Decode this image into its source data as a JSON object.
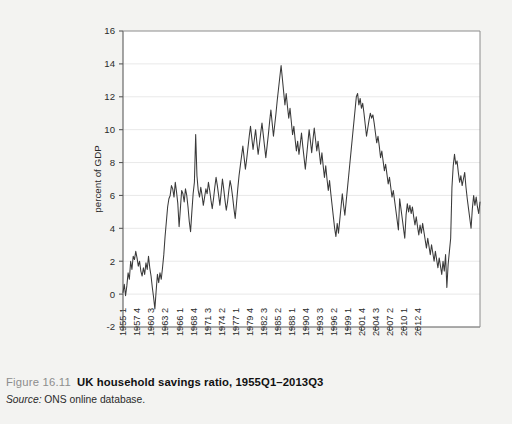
{
  "caption": {
    "figure_number": "Figure 16.11",
    "title": "UK household savings ratio, 1955Q1–2013Q3",
    "source_label": "Source:",
    "source_text": " ONS online database."
  },
  "chart_data": {
    "type": "line",
    "title": "",
    "xlabel": "",
    "ylabel": "percent of GDP",
    "ylim": [
      -2,
      16
    ],
    "ytick_values": [
      -2,
      0,
      2,
      4,
      6,
      8,
      10,
      12,
      14,
      16
    ],
    "ytick_labels": [
      "-2",
      "0",
      "2",
      "4",
      "6",
      "8",
      "10",
      "12",
      "14",
      "16"
    ],
    "grid": "horizontal",
    "legend": "none",
    "line_color": "#3a3a3a",
    "xtick_labels": [
      "1955 1",
      "1957 4",
      "1960 3",
      "1963 2",
      "1966 1",
      "1968 4",
      "1971 3",
      "1974 2",
      "1977 1",
      "1979 4",
      "1982 3",
      "1985 2",
      "1988 1",
      "1990 4",
      "1993 3",
      "1996 2",
      "1999 1",
      "2001 4",
      "2004 3",
      "2007 2",
      "2010 1",
      "2012 4"
    ],
    "xtick_indices": [
      0,
      11,
      22,
      33,
      44,
      55,
      66,
      77,
      88,
      99,
      110,
      121,
      132,
      143,
      154,
      165,
      176,
      187,
      198,
      209,
      220,
      231
    ],
    "x_start": "1955Q1",
    "x_end": "2013Q3",
    "n_points": 235,
    "values": [
      0.1,
      0.6,
      -0.1,
      0.5,
      1.3,
      0.9,
      2.0,
      1.5,
      2.3,
      2.1,
      2.6,
      2.2,
      1.7,
      2.0,
      1.4,
      1.1,
      1.6,
      1.2,
      1.9,
      1.5,
      2.3,
      1.6,
      1.1,
      0.4,
      -0.2,
      -0.9,
      0.2,
      1.2,
      0.7,
      1.3,
      0.9,
      1.6,
      2.4,
      3.5,
      4.4,
      5.3,
      5.8,
      6.0,
      6.6,
      6.4,
      5.9,
      6.8,
      6.2,
      5.5,
      4.1,
      5.2,
      6.3,
      6.1,
      5.6,
      6.4,
      6.0,
      5.3,
      4.4,
      3.8,
      5.0,
      6.1,
      6.8,
      9.7,
      7.2,
      6.3,
      5.9,
      6.5,
      6.0,
      5.4,
      5.9,
      6.4,
      6.1,
      6.8,
      6.3,
      5.7,
      5.2,
      5.8,
      6.5,
      7.1,
      6.6,
      6.0,
      5.4,
      6.2,
      7.0,
      6.4,
      5.7,
      5.1,
      5.6,
      6.3,
      6.9,
      6.5,
      5.9,
      5.2,
      4.6,
      5.5,
      6.4,
      7.2,
      7.8,
      8.4,
      9.0,
      8.3,
      7.6,
      8.2,
      8.9,
      9.6,
      10.2,
      9.5,
      8.8,
      9.4,
      10.0,
      9.2,
      8.5,
      9.1,
      9.8,
      10.4,
      9.7,
      9.0,
      8.3,
      9.0,
      9.7,
      10.5,
      11.2,
      10.4,
      9.6,
      10.3,
      11.0,
      11.8,
      12.5,
      13.2,
      13.9,
      13.1,
      12.3,
      11.5,
      12.2,
      11.4,
      10.7,
      11.3,
      10.5,
      9.7,
      10.2,
      9.4,
      8.7,
      9.3,
      8.5,
      9.1,
      9.8,
      9.0,
      8.3,
      7.6,
      8.4,
      9.2,
      10.0,
      9.3,
      8.6,
      9.4,
      10.1,
      9.4,
      8.7,
      9.3,
      8.6,
      7.9,
      8.6,
      7.8,
      7.1,
      7.8,
      7.0,
      6.3,
      6.9,
      6.1,
      5.4,
      4.7,
      4.0,
      3.5,
      4.3,
      3.7,
      4.5,
      5.3,
      6.1,
      5.4,
      4.8,
      5.6,
      6.4,
      7.2,
      8.0,
      8.8,
      9.6,
      10.4,
      11.2,
      12.0,
      12.2,
      11.5,
      11.9,
      11.3,
      11.6,
      11.0,
      10.3,
      9.6,
      10.1,
      10.6,
      11.0,
      10.7,
      10.9,
      10.4,
      9.8,
      9.2,
      9.6,
      9.0,
      8.3,
      8.7,
      8.1,
      7.5,
      7.9,
      7.3,
      6.7,
      7.1,
      6.5,
      5.9,
      6.3,
      5.7,
      5.1,
      4.5,
      3.9,
      5.8,
      5.2,
      4.6,
      4.0,
      3.4,
      4.8,
      5.5,
      5.0,
      5.4,
      4.9,
      5.3,
      4.7,
      4.2,
      4.7,
      4.1,
      3.6,
      4.2,
      3.7,
      4.3,
      3.8,
      3.3,
      2.8,
      3.4,
      2.9,
      2.4,
      3.0,
      2.5,
      2.0,
      2.6,
      2.1,
      1.6,
      2.2,
      1.7,
      1.2,
      2.0,
      1.4,
      2.4,
      0.4,
      1.8,
      2.6,
      3.4,
      6.5,
      7.8,
      8.5,
      7.9,
      8.1,
      7.4,
      6.8,
      7.2,
      6.6,
      7.0,
      7.4,
      6.5,
      5.8,
      5.2,
      4.6,
      4.0,
      5.2,
      6.0,
      5.4,
      5.9,
      5.3,
      4.9,
      5.6
    ]
  }
}
